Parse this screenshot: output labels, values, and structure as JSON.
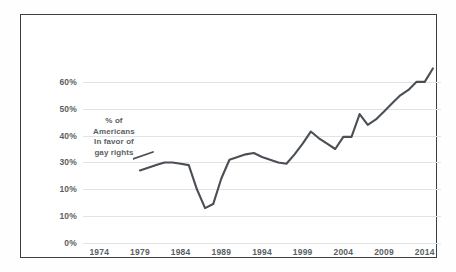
{
  "chart_data": {
    "type": "line",
    "title": "",
    "subtitle": "",
    "xlabel": "",
    "ylabel": "",
    "annotation": {
      "lines": [
        "% of",
        "Americans",
        "In favor of",
        "gay rights"
      ],
      "pointer": "leader-line pointing right to the series start"
    },
    "grid": true,
    "legend_position": "none",
    "xlim": [
      1972,
      2016
    ],
    "ylim": [
      0,
      70
    ],
    "xticks": [
      1974,
      1979,
      1984,
      1989,
      1994,
      1999,
      2004,
      2009,
      2014
    ],
    "xtick_labels": [
      "1974",
      "1979",
      "1984",
      "1989",
      "1994",
      "1999",
      "2004",
      "2009",
      "2014"
    ],
    "yticks": [
      0,
      10,
      20,
      30,
      40,
      50,
      60
    ],
    "ytick_labels": [
      "0%",
      "10%",
      "10%",
      "30%",
      "40%",
      "50%",
      "60%"
    ],
    "series": [
      {
        "name": "% of Americans in favor of gay rights",
        "color": "#4a4f55",
        "x": [
          1979,
          1980,
          1981,
          1982,
          1983,
          1984,
          1985,
          1986,
          1987,
          1988,
          1989,
          1990,
          1991,
          1992,
          1993,
          1994,
          1995,
          1996,
          1997,
          1998,
          1999,
          2000,
          2001,
          2002,
          2003,
          2004,
          2005,
          2006,
          2007,
          2008,
          2009,
          2010,
          2011,
          2012,
          2013,
          2014,
          2015
        ],
        "values": [
          27,
          28,
          29,
          30,
          30,
          29.5,
          29,
          20,
          13,
          14.5,
          24,
          31,
          32,
          33,
          33.5,
          32,
          31,
          30,
          29.5,
          33,
          37,
          41.5,
          39,
          37,
          35,
          39.5,
          39.5,
          48,
          44,
          46,
          49,
          52,
          55,
          57,
          60,
          60,
          65
        ]
      }
    ]
  }
}
